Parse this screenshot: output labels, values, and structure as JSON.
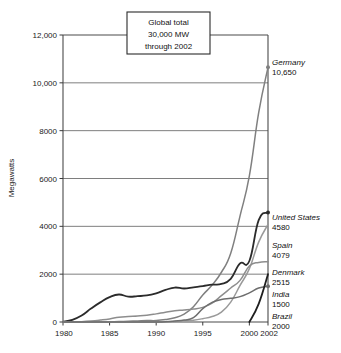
{
  "chart_data": {
    "type": "line",
    "title": "",
    "xlabel": "",
    "ylabel": "Megawatts",
    "xlim": [
      1980,
      2002
    ],
    "ylim": [
      0,
      12000
    ],
    "grid": true,
    "legend_position": "right-inline-end-labels",
    "x_ticks": [
      "1980",
      "1985",
      "1990",
      "1995",
      "2000",
      "2002"
    ],
    "x_tick_values": [
      1980,
      1985,
      1990,
      1995,
      2000,
      2002
    ],
    "y_ticks": [
      "0",
      "2000",
      "4000",
      "6000",
      "8000",
      "10,000",
      "12,000"
    ],
    "y_tick_values": [
      0,
      2000,
      4000,
      6000,
      8000,
      10000,
      12000
    ],
    "annotation": {
      "line1": "Global total",
      "line2": "30,000 MW",
      "line3": "through 2002"
    },
    "x": [
      1980,
      1981,
      1982,
      1983,
      1984,
      1985,
      1986,
      1987,
      1988,
      1989,
      1990,
      1991,
      1992,
      1993,
      1994,
      1995,
      1996,
      1997,
      1998,
      1999,
      2000,
      2001,
      2002
    ],
    "series": [
      {
        "name": "Germany",
        "end_value": "10,650",
        "end_value_num": 10650,
        "color": "#808080",
        "values": [
          0,
          0,
          0,
          0,
          5,
          10,
          20,
          30,
          45,
          60,
          60,
          100,
          175,
          330,
          640,
          1130,
          1545,
          2080,
          2875,
          4440,
          6110,
          8750,
          10650
        ]
      },
      {
        "name": "United States",
        "end_value": "4580",
        "end_value_num": 4580,
        "color": "#2b2b2b",
        "values": [
          10,
          90,
          270,
          560,
          820,
          1040,
          1150,
          1060,
          1080,
          1110,
          1200,
          1340,
          1440,
          1400,
          1450,
          1500,
          1560,
          1590,
          1800,
          2450,
          2550,
          4260,
          4580
        ]
      },
      {
        "name": "Spain",
        "end_value": "4079",
        "end_value_num": 4079,
        "color": "#9a9a9a",
        "values": [
          0,
          0,
          0,
          0,
          0,
          0,
          0,
          0,
          0,
          0,
          5,
          10,
          25,
          50,
          75,
          140,
          230,
          410,
          830,
          1530,
          2230,
          3340,
          4079
        ]
      },
      {
        "name": "Denmark",
        "end_value": "2515",
        "end_value_num": 2515,
        "color": "#8d8d8d",
        "values": [
          0,
          5,
          15,
          40,
          80,
          130,
          200,
          230,
          250,
          280,
          340,
          410,
          470,
          500,
          540,
          610,
          790,
          1100,
          1420,
          1740,
          2340,
          2490,
          2515
        ]
      },
      {
        "name": "India",
        "end_value": "1500",
        "end_value_num": 1500,
        "color": "#6e6e6e",
        "values": [
          0,
          0,
          0,
          0,
          0,
          0,
          0,
          0,
          0,
          0,
          0,
          10,
          40,
          80,
          180,
          560,
          820,
          940,
          990,
          1060,
          1220,
          1420,
          1500
        ]
      },
      {
        "name": "Brazil",
        "end_value": "2000",
        "end_value_num": 2000,
        "color": "#1f1f1f",
        "values": [
          null,
          null,
          null,
          null,
          null,
          null,
          null,
          null,
          null,
          null,
          null,
          null,
          null,
          null,
          null,
          null,
          null,
          null,
          null,
          null,
          0,
          760,
          2000
        ]
      }
    ]
  }
}
